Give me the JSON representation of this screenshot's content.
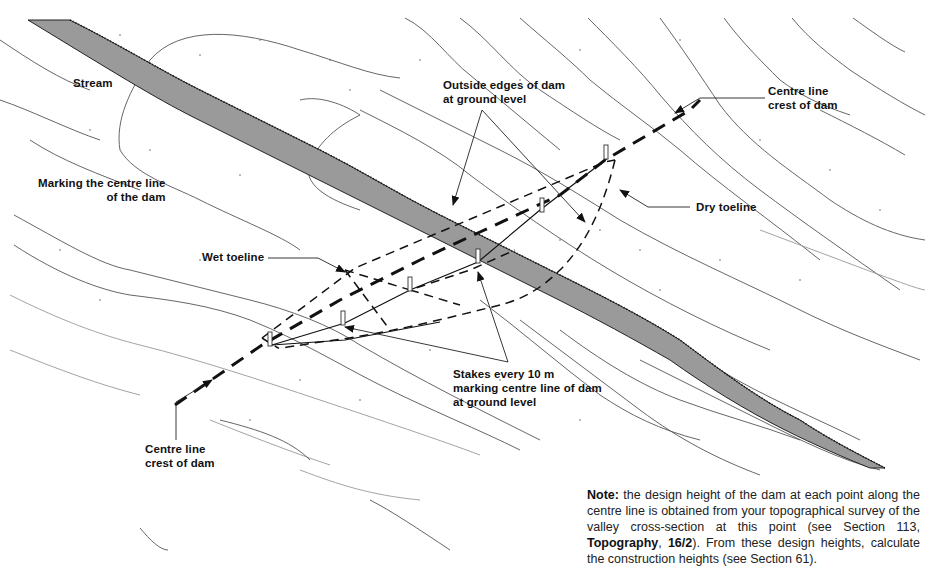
{
  "figure": {
    "title": "Marking the centre line of the dam",
    "labels": {
      "stream": "Stream",
      "marking_line1": "Marking the centre line",
      "marking_line2": "of the dam",
      "outside_edges_line1": "Outside edges of dam",
      "outside_edges_line2": "at ground level",
      "centre_line_top_line1": "Centre line",
      "centre_line_top_line2": "crest of dam",
      "dry_toeline": "Dry toeline",
      "wet_toeline": "Wet toeline",
      "stakes_line1": "Stakes every 10 m",
      "stakes_line2": "marking centre line of dam",
      "stakes_line3": "at ground level",
      "centre_line_bottom_line1": "Centre line",
      "centre_line_bottom_line2": "crest of dam"
    },
    "stake_spacing": "10 m",
    "colors": {
      "stream_fill": "#9a9a9a",
      "line": "#111111",
      "contour": "#555555",
      "background": "#ffffff"
    }
  },
  "note": {
    "lead": "Note:",
    "text1": " the design height of the dam at each point along the centre line is obtained from your topographical survey of the valley cross-section at this point (see Section 113, ",
    "ref_bold1": "Topography",
    "text2": ", ",
    "ref_bold2": "16/2",
    "text3": "). From these design heights, calculate the construction heights (see Section 61)."
  }
}
